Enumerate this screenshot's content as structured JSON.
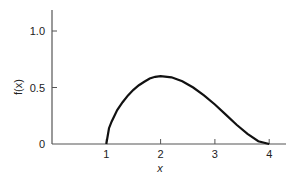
{
  "chart_data": {
    "type": "line",
    "title": "",
    "xlabel": "x",
    "ylabel": "f(x)",
    "xlim": [
      0,
      4.3
    ],
    "ylim": [
      0,
      1.2
    ],
    "x_ticks": [
      "1",
      "2",
      "3",
      "4"
    ],
    "y_ticks": [
      "0",
      "0.5",
      "1.0"
    ],
    "grid": false,
    "series": [
      {
        "name": "f(x)",
        "x": [
          1.0,
          1.05,
          1.1,
          1.2,
          1.3,
          1.4,
          1.5,
          1.6,
          1.7,
          1.8,
          1.9,
          2.0,
          2.2,
          2.4,
          2.6,
          2.8,
          3.0,
          3.2,
          3.4,
          3.6,
          3.8,
          4.0
        ],
        "values": [
          0.0,
          0.14,
          0.2,
          0.3,
          0.37,
          0.43,
          0.48,
          0.52,
          0.55,
          0.58,
          0.595,
          0.6,
          0.59,
          0.555,
          0.5,
          0.43,
          0.35,
          0.26,
          0.17,
          0.09,
          0.025,
          0.0
        ]
      }
    ]
  }
}
